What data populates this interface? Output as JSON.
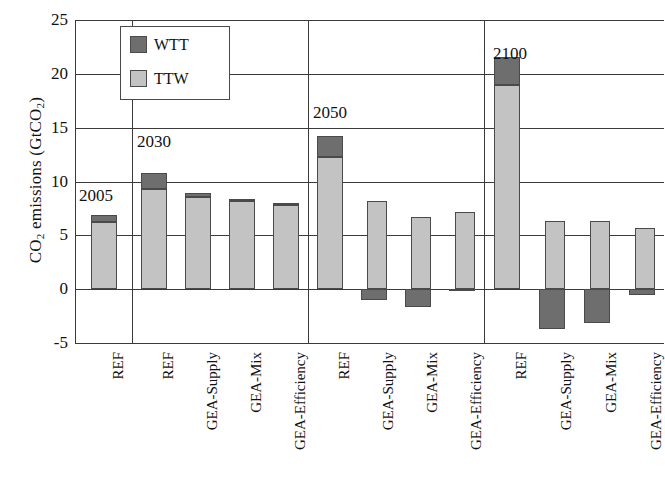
{
  "chart_data": {
    "type": "bar",
    "title": "",
    "xlabel": "",
    "ylabel": "CO2 emissions (GtCO2)",
    "ylabel_parts": {
      "pre": "CO",
      "sub1": "2",
      "mid": " emissions (GtCO",
      "sub2": "2",
      "post": ")"
    },
    "ylim": [
      -5,
      25
    ],
    "yticks": [
      25,
      20,
      15,
      10,
      5,
      0,
      -5
    ],
    "grid": true,
    "legend_position": "top-left-inside",
    "stacked": true,
    "legend": [
      "WTT",
      "TTW"
    ],
    "series": [
      {
        "name": "TTW",
        "color": "#c3c3c3",
        "values": [
          6.2,
          9.3,
          8.6,
          8.2,
          7.8,
          12.3,
          8.2,
          6.7,
          7.2,
          19.0,
          6.3,
          6.3,
          5.7
        ]
      },
      {
        "name": "WTT",
        "color": "#6e6e6e",
        "values": [
          0.7,
          1.5,
          0.3,
          0.2,
          0.2,
          1.9,
          -1.0,
          -1.7,
          -0.1,
          2.6,
          -3.7,
          -3.1,
          -0.5
        ]
      }
    ],
    "categories": [
      "REF",
      "REF",
      "GEA-Supply",
      "GEA-Mix",
      "GEA-Efficiency",
      "REF",
      "GEA-Supply",
      "GEA-Mix",
      "GEA-Efficiency",
      "REF",
      "GEA-Supply",
      "GEA-Mix",
      "GEA-Efficiency"
    ],
    "groups": [
      {
        "year": "2005",
        "count": 1
      },
      {
        "year": "2030",
        "count": 4
      },
      {
        "year": "2050",
        "count": 4
      },
      {
        "year": "2100",
        "count": 4
      }
    ],
    "group_labels": [
      "2005",
      "2030",
      "2050",
      "2100"
    ]
  },
  "colors": {
    "wtt": "#6e6e6e",
    "ttw": "#c3c3c3",
    "axis": "#3a3a3a",
    "background": "#ffffff"
  }
}
